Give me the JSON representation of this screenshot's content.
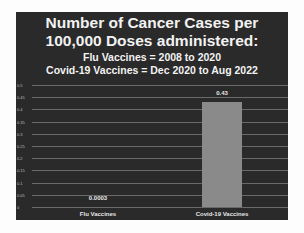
{
  "slide": {
    "title_line1": "Number of Cancer Cases per",
    "title_line2": "100,000 Doses administered:",
    "subtitle_line1": "Flu Vaccines = 2008 to 2020",
    "subtitle_line2": "Covid-19 Vaccines = Dec 2020 to Aug 2022"
  },
  "chart_data": {
    "type": "bar",
    "title": "Number of Cancer Cases per 100,000 Doses administered",
    "subtitle": [
      "Flu Vaccines = 2008 to 2020",
      "Covid-19 Vaccines = Dec 2020 to Aug 2022"
    ],
    "categories": [
      "Flu Vaccines",
      "Covid-19 Vaccines"
    ],
    "values": [
      0.0003,
      0.43
    ],
    "data_labels": [
      "0.0003",
      "0.43"
    ],
    "xlabel": "",
    "ylabel": "",
    "ylim": [
      0,
      0.5
    ],
    "yticks": [
      "0",
      "0.05",
      "0.1",
      "0.15",
      "0.2",
      "0.25",
      "0.3",
      "0.35",
      "0.4",
      "0.45",
      "0.5"
    ],
    "grid": true,
    "legend": "none",
    "colors": {
      "background": "#2a2a2a",
      "bar": "#8a8a8a",
      "text": "#f2f2f2",
      "grid": "#6a6a6a"
    }
  }
}
